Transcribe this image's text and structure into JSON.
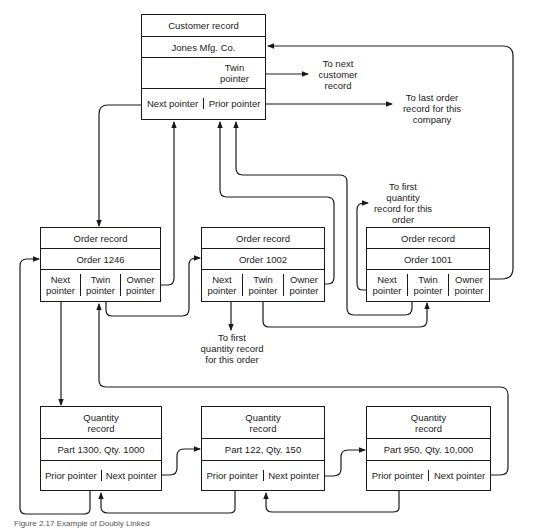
{
  "customer_record": {
    "title": "Customer record",
    "name": "Jones Mfg. Co.",
    "twin_pointer": "Twin\npointer",
    "next_pointer": "Next pointer",
    "prior_pointer": "Prior pointer"
  },
  "annotations": {
    "to_next_customer": "To next\ncustomer\nrecord",
    "to_last_order": "To last order\nrecord for this\ncompany",
    "to_first_qty_1001": "To first\nquantity\nrecord for this\norder",
    "to_first_qty_1002": "To first\nquantity record\nfor this order"
  },
  "order_records": [
    {
      "title": "Order record",
      "id": "Order 1246",
      "next": "Next\npointer",
      "twin": "Twin\npointer",
      "owner": "Owner\npointer"
    },
    {
      "title": "Order record",
      "id": "Order 1002",
      "next": "Next\npointer",
      "twin": "Twin\npointer",
      "owner": "Owner\npointer"
    },
    {
      "title": "Order record",
      "id": "Order 1001",
      "next": "Next\npointer",
      "twin": "Twin\npointer",
      "owner": "Owner\npointer"
    }
  ],
  "quantity_records": [
    {
      "title": "Quantity\nrecord",
      "detail": "Part 1300, Qty. 1000",
      "prior": "Prior pointer",
      "next": "Next pointer"
    },
    {
      "title": "Quantity\nrecord",
      "detail": "Part 122, Qty. 150",
      "prior": "Prior pointer",
      "next": "Next pointer"
    },
    {
      "title": "Quantity\nrecord",
      "detail": "Part 950, Qty. 10,000",
      "prior": "Prior pointer",
      "next": "Next pointer"
    }
  ],
  "caption": "Figure 2.17  Example of Doubly Linked"
}
